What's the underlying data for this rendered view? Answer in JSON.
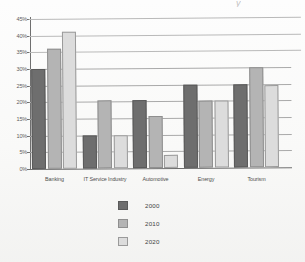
{
  "chart_data": {
    "type": "bar",
    "title": "",
    "title_fragment": "y",
    "xlabel": "",
    "ylabel": "",
    "categories": [
      "Banking",
      "IT Service Industry",
      "Automotive",
      "Energy",
      "Tourism"
    ],
    "series": [
      {
        "name": "2000",
        "color": "#6e6e6e",
        "values": [
          30,
          10,
          20.5,
          25,
          25
        ]
      },
      {
        "name": "2010",
        "color": "#b4b4b4",
        "values": [
          36,
          20.5,
          15.5,
          20,
          30
        ]
      },
      {
        "name": "2020",
        "color": "#dcdcdc",
        "values": [
          41,
          10,
          4,
          20,
          24.5
        ]
      }
    ],
    "ylim": [
      0,
      45
    ],
    "ytick_step": 5,
    "ytick_labels": [
      "0%",
      "5%",
      "10%",
      "15%",
      "20%",
      "25%",
      "30%",
      "35%",
      "40%",
      "45%"
    ],
    "ytick_values": [
      0,
      5,
      10,
      15,
      20,
      25,
      30,
      35,
      40,
      45
    ],
    "grid": true,
    "grid_axis": "y",
    "legend_position": "bottom-center",
    "value_unit": "%"
  },
  "legend": {
    "items": [
      {
        "label": "2000"
      },
      {
        "label": "2010"
      },
      {
        "label": "2020"
      }
    ]
  }
}
